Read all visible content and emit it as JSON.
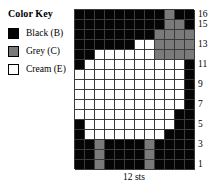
{
  "legend": {
    "title": "Color Key",
    "items": [
      {
        "label": "Black (B)",
        "code": "B",
        "color": "#050505"
      },
      {
        "label": "Grey (C)",
        "code": "C",
        "color": "#7a7a7a"
      },
      {
        "label": "Cream (E)",
        "code": "E",
        "color": "#ffffff"
      }
    ]
  },
  "caption": "12 sts",
  "chart_data": {
    "type": "heatmap",
    "title": "Color Key",
    "xlabel": "12 sts",
    "ylabel": "",
    "columns": 12,
    "rows": 16,
    "grid_on": true,
    "legend_position": "left",
    "palette": {
      "B": "#050505",
      "C": "#7a7a7a",
      "E": "#ffffff"
    },
    "row_labels_visible": [
      "16",
      "15",
      "13",
      "11",
      "9",
      "7",
      "5",
      "3",
      "1"
    ],
    "row_numbers_top_to_bottom": [
      16,
      15,
      14,
      13,
      12,
      11,
      10,
      9,
      8,
      7,
      6,
      5,
      4,
      3,
      2,
      1
    ],
    "cells": [
      [
        "B",
        "B",
        "B",
        "B",
        "B",
        "B",
        "B",
        "B",
        "B",
        "C",
        "B",
        "B"
      ],
      [
        "B",
        "B",
        "B",
        "B",
        "B",
        "B",
        "B",
        "B",
        "B",
        "C",
        "C",
        "B"
      ],
      [
        "B",
        "B",
        "B",
        "B",
        "B",
        "B",
        "B",
        "B",
        "C",
        "C",
        "C",
        "C"
      ],
      [
        "B",
        "B",
        "B",
        "B",
        "B",
        "B",
        "E",
        "E",
        "C",
        "C",
        "C",
        "C"
      ],
      [
        "B",
        "B",
        "E",
        "E",
        "E",
        "E",
        "E",
        "E",
        "C",
        "C",
        "C",
        "C"
      ],
      [
        "B",
        "E",
        "E",
        "E",
        "E",
        "E",
        "E",
        "E",
        "E",
        "E",
        "E",
        "B"
      ],
      [
        "E",
        "E",
        "E",
        "E",
        "E",
        "E",
        "E",
        "E",
        "E",
        "E",
        "E",
        "B"
      ],
      [
        "E",
        "E",
        "E",
        "E",
        "E",
        "E",
        "E",
        "E",
        "E",
        "E",
        "E",
        "B"
      ],
      [
        "E",
        "E",
        "E",
        "E",
        "E",
        "E",
        "E",
        "E",
        "E",
        "E",
        "E",
        "B"
      ],
      [
        "E",
        "E",
        "E",
        "E",
        "E",
        "E",
        "E",
        "E",
        "E",
        "E",
        "E",
        "B"
      ],
      [
        "E",
        "E",
        "E",
        "E",
        "E",
        "E",
        "E",
        "E",
        "E",
        "E",
        "B",
        "B"
      ],
      [
        "B",
        "E",
        "E",
        "E",
        "E",
        "E",
        "E",
        "E",
        "E",
        "E",
        "B",
        "B"
      ],
      [
        "B",
        "E",
        "E",
        "E",
        "E",
        "E",
        "E",
        "E",
        "E",
        "B",
        "B",
        "B"
      ],
      [
        "B",
        "B",
        "C",
        "B",
        "B",
        "B",
        "B",
        "C",
        "B",
        "B",
        "B",
        "B"
      ],
      [
        "B",
        "B",
        "C",
        "B",
        "B",
        "B",
        "B",
        "C",
        "B",
        "B",
        "B",
        "B"
      ],
      [
        "B",
        "B",
        "C",
        "B",
        "B",
        "B",
        "B",
        "C",
        "B",
        "B",
        "B",
        "B"
      ]
    ]
  }
}
